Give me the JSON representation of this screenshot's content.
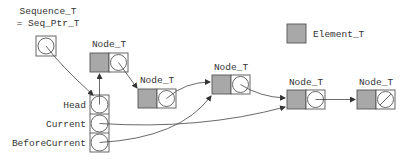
{
  "diagram": {
    "title_line1": "Sequence_T",
    "title_line2": "= Seq_Ptr_T",
    "legend": {
      "label": "Element_T",
      "color": "#a8a8a8"
    },
    "descriptor_fields": [
      {
        "label": "Head"
      },
      {
        "label": "Current"
      },
      {
        "label": "BeforeCurrent"
      }
    ],
    "nodes": [
      {
        "label": "Node_T"
      },
      {
        "label": "Node_T"
      },
      {
        "label": "Node_T"
      },
      {
        "label": "Node_T"
      },
      {
        "label": "Node_T",
        "null_next": true
      }
    ],
    "edges": [
      {
        "from": "Sequence_T",
        "to": "descriptor"
      },
      {
        "from": "Head",
        "to": "node-1"
      },
      {
        "from": "node-1",
        "to": "node-2"
      },
      {
        "from": "node-2",
        "to": "node-3"
      },
      {
        "from": "node-3",
        "to": "node-4"
      },
      {
        "from": "node-4",
        "to": "node-5"
      },
      {
        "from": "Current",
        "to": "node-4"
      },
      {
        "from": "BeforeCurrent",
        "to": "node-3"
      }
    ]
  }
}
